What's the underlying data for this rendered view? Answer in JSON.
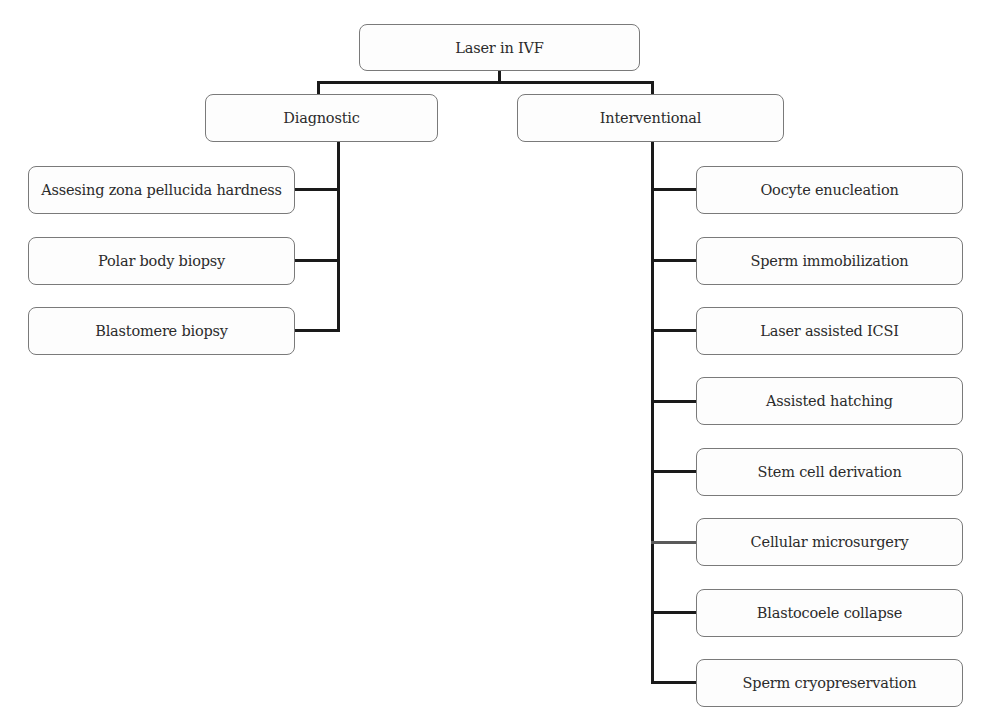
{
  "diagram": {
    "type": "tree",
    "root": {
      "label": "Laser in IVF"
    },
    "branches": [
      {
        "label": "Diagnostic",
        "children": [
          "Assesing zona pellucida hardness",
          "Polar body biopsy",
          "Blastomere biopsy"
        ]
      },
      {
        "label": "Interventional",
        "children": [
          "Oocyte enucleation",
          "Sperm immobilization",
          "Laser assisted ICSI",
          "Assisted hatching",
          "Stem cell derivation",
          "Cellular microsurgery",
          "Blastocoele collapse",
          "Sperm cryopreservation"
        ]
      }
    ],
    "colors": {
      "box_border": "#7a7a7a",
      "box_fill": "#fdfdfd",
      "connector": "#1a1a1a",
      "text": "#2b2b2b"
    }
  }
}
